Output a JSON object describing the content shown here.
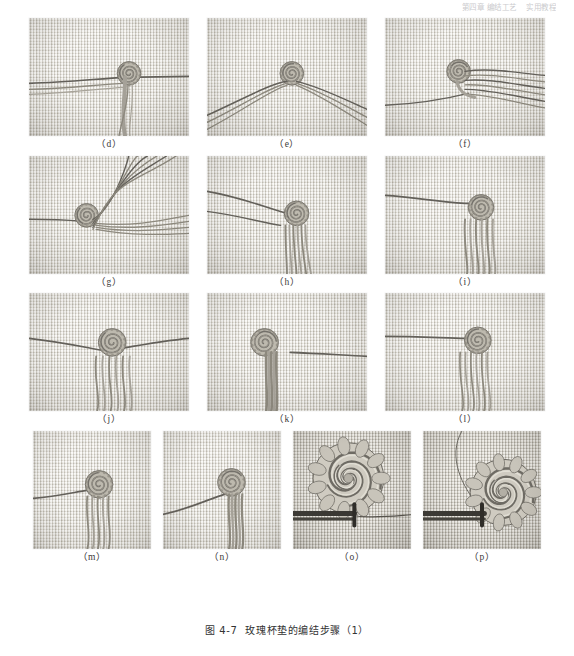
{
  "header": {
    "title": "第四章 编结工艺",
    "subtitle": "实用教程"
  },
  "figure": {
    "caption_number": "图 4-7",
    "caption_text": "玫瑰杯垫的编结步骤（1）",
    "caption_full": "图 4-7　玫瑰杯垫的编结步骤（1）"
  },
  "colors": {
    "cloth_light": "#e3e0d8",
    "cloth_dark": "#cfccc3",
    "cord": "#8d897e",
    "cord_dark": "#5f5c55",
    "page_background": "#ffffff",
    "caption_text": "#333333",
    "label_text": "#3a3a3a"
  },
  "rows": [
    {
      "row_index": 1,
      "panels": [
        {
          "label": "（d）",
          "alt": "spiral-knot-with-two-horizontal-cords",
          "variant": "d",
          "width": 160,
          "height": 118
        },
        {
          "label": "（e）",
          "alt": "spiral-knot-at-apex-cords-fanning-both-sides",
          "variant": "e",
          "width": 160,
          "height": 118
        },
        {
          "label": "（f）",
          "alt": "spiral-knot-with-cords-fanning-right",
          "variant": "f",
          "width": 160,
          "height": 118
        }
      ]
    },
    {
      "row_index": 2,
      "panels": [
        {
          "label": "（g）",
          "alt": "spiral-knot-cords-arcing-upper-right",
          "variant": "g",
          "width": 160,
          "height": 118
        },
        {
          "label": "（h）",
          "alt": "spiral-knot-with-cord-tassel-hanging-down",
          "variant": "h",
          "width": 160,
          "height": 118
        },
        {
          "label": "（i）",
          "alt": "spiral-knot-with-long-looping-cords",
          "variant": "i",
          "width": 160,
          "height": 118
        }
      ]
    },
    {
      "row_index": 3,
      "panels": [
        {
          "label": "（j）",
          "alt": "centered-spiral-knot-with-six-hanging-cords",
          "variant": "j",
          "width": 160,
          "height": 118
        },
        {
          "label": "（k）",
          "alt": "spiral-knot-with-bundled-tassel",
          "variant": "k",
          "width": 160,
          "height": 118
        },
        {
          "label": "（l）",
          "alt": "spiral-knot-with-looped-cord-bundle",
          "variant": "l",
          "width": 160,
          "height": 118
        }
      ]
    },
    {
      "row_index": 4,
      "panels": [
        {
          "label": "（m）",
          "alt": "tightened-spiral-knot-with-cord-bundle",
          "variant": "m",
          "width": 118,
          "height": 118
        },
        {
          "label": "（n）",
          "alt": "spiral-knot-with-diagonal-cord",
          "variant": "n",
          "width": 118,
          "height": 118
        },
        {
          "label": "（o）",
          "alt": "finished-macrame-rose-flower",
          "variant": "o",
          "width": 118,
          "height": 118
        },
        {
          "label": "（p）",
          "alt": "finished-rose-on-stem-cord",
          "variant": "p",
          "width": 118,
          "height": 118
        }
      ]
    }
  ]
}
